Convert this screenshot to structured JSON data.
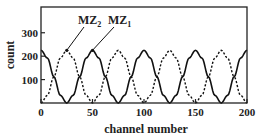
{
  "chart_data": {
    "type": "line",
    "title": "",
    "xlabel": "channel number",
    "ylabel": "count",
    "xlim": [
      0,
      200
    ],
    "ylim": [
      0,
      410
    ],
    "grid": false,
    "x_ticks": [
      0,
      50,
      100,
      150,
      200
    ],
    "y_ticks": [
      100,
      200,
      300
    ],
    "x": [
      0,
      6.25,
      12.5,
      18.75,
      25,
      31.25,
      37.5,
      43.75,
      50,
      56.25,
      62.5,
      68.75,
      75,
      81.25,
      87.5,
      93.75,
      100,
      106.25,
      112.5,
      118.75,
      125,
      131.25,
      137.5,
      143.75,
      150,
      156.25,
      162.5,
      168.75,
      175,
      181.25,
      187.5,
      193.75,
      200
    ],
    "series": [
      {
        "name": "MZ1",
        "style": "solid",
        "values": [
          225,
          192,
          112,
          33,
          0,
          33,
          112,
          192,
          225,
          192,
          112,
          33,
          0,
          33,
          112,
          192,
          225,
          192,
          112,
          33,
          0,
          33,
          112,
          192,
          225,
          192,
          112,
          33,
          0,
          33,
          112,
          192,
          225
        ]
      },
      {
        "name": "MZ2",
        "style": "dashed",
        "values": [
          0,
          33,
          112,
          192,
          225,
          192,
          112,
          33,
          0,
          33,
          112,
          192,
          225,
          192,
          112,
          33,
          0,
          33,
          112,
          192,
          225,
          192,
          112,
          33,
          0,
          33,
          112,
          192,
          225,
          192,
          112,
          33,
          0
        ]
      }
    ],
    "annotations": [
      {
        "text": "MZ2",
        "main": "MZ",
        "sub": "2",
        "points_to_series": "MZ2",
        "points_to_x": 25
      },
      {
        "text": "MZ1",
        "main": "MZ",
        "sub": "1",
        "points_to_series": "MZ1",
        "points_to_x": 50
      }
    ],
    "legend_position": "inline annotations, top"
  }
}
